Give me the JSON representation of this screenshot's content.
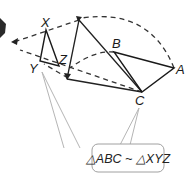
{
  "diagram": {
    "type": "similarity-transformation",
    "labels": {
      "X": "X",
      "Y": "Y",
      "Z": "Z",
      "A": "A",
      "B": "B",
      "C": "C"
    },
    "callout": {
      "text": "△ABC ~ △XYZ"
    },
    "colors": {
      "stroke": "#1a1a1a",
      "callout_border": "#9a9a9a",
      "callout_pointer": "#b0b0b0",
      "background": "#ffffff"
    }
  }
}
